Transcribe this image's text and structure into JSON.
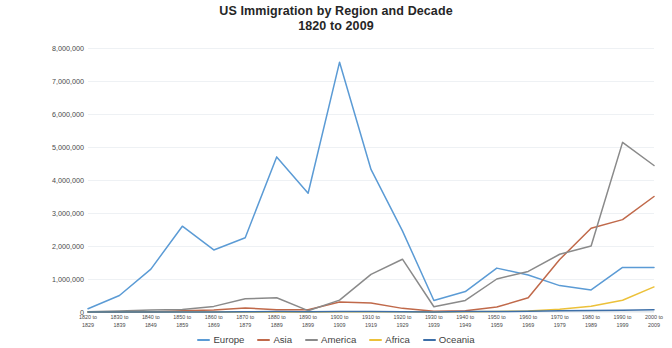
{
  "chart_data": {
    "type": "line",
    "title": "US Immigration by Region and Decade",
    "subtitle": "1820 to 2009",
    "xlabel": "",
    "ylabel": "",
    "ylim": [
      0,
      8000000
    ],
    "ytick_labels": [
      "0",
      "1,000,000",
      "2,000,000",
      "3,000,000",
      "4,000,000",
      "5,000,000",
      "6,000,000",
      "7,000,000",
      "8,000,000"
    ],
    "ytick_values": [
      0,
      1000000,
      2000000,
      3000000,
      4000000,
      5000000,
      6000000,
      7000000,
      8000000
    ],
    "grid": true,
    "legend_position": "bottom",
    "categories": [
      "1820 to 1829",
      "1830 to 1839",
      "1840 to 1849",
      "1850 to 1859",
      "1860 to 1869",
      "1870 to 1879",
      "1880 to 1889",
      "1890 to 1899",
      "1900 to 1909",
      "1910 to 1919",
      "1920 to 1929",
      "1930 to 1939",
      "1940 to 1949",
      "1950 to 1959",
      "1960 to 1969",
      "1970 to 1979",
      "1980 to 1989",
      "1990 to 1999",
      "2000 to 2009"
    ],
    "category_lines": [
      [
        "1820 to",
        "1829"
      ],
      [
        "1830 to",
        "1839"
      ],
      [
        "1840 to",
        "1849"
      ],
      [
        "1850 to",
        "1859"
      ],
      [
        "1860 to",
        "1869"
      ],
      [
        "1870 to",
        "1879"
      ],
      [
        "1880 to",
        "1889"
      ],
      [
        "1890 to",
        "1899"
      ],
      [
        "1900 to",
        "1909"
      ],
      [
        "1910 to",
        "1919"
      ],
      [
        "1920 to",
        "1929"
      ],
      [
        "1930 to",
        "1939"
      ],
      [
        "1940 to",
        "1949"
      ],
      [
        "1950 to",
        "1959"
      ],
      [
        "1960 to",
        "1969"
      ],
      [
        "1970 to",
        "1979"
      ],
      [
        "1980 to",
        "1989"
      ],
      [
        "1990 to",
        "1999"
      ],
      [
        "2000 to",
        "2009"
      ]
    ],
    "series": [
      {
        "name": "Europe",
        "color": "#5b9bd5",
        "values": [
          100000,
          500000,
          1300000,
          2600000,
          1880000,
          2250000,
          4700000,
          3600000,
          7570000,
          4320000,
          2460000,
          350000,
          620000,
          1330000,
          1120000,
          800000,
          670000,
          1350000,
          1350000
        ]
      },
      {
        "name": "Asia",
        "color": "#c0694a",
        "values": [
          0,
          0,
          0,
          40000,
          60000,
          120000,
          70000,
          70000,
          300000,
          270000,
          110000,
          20000,
          35000,
          150000,
          430000,
          1590000,
          2540000,
          2800000,
          3500000
        ]
      },
      {
        "name": "America",
        "color": "#8a8a8a",
        "values": [
          10000,
          30000,
          60000,
          75000,
          170000,
          400000,
          430000,
          40000,
          360000,
          1140000,
          1600000,
          160000,
          350000,
          1000000,
          1230000,
          1750000,
          2000000,
          5140000,
          4440000
        ]
      },
      {
        "name": "Africa",
        "color": "#ecc13a",
        "values": [
          0,
          0,
          0,
          0,
          0,
          0,
          0,
          0,
          7000,
          8000,
          6000,
          2000,
          7000,
          14000,
          29000,
          80000,
          177000,
          355000,
          760000
        ]
      },
      {
        "name": "Oceania",
        "color": "#3d6fa8",
        "values": [
          0,
          0,
          0,
          0,
          0,
          10000,
          13000,
          4000,
          13000,
          13000,
          9000,
          2000,
          14000,
          12000,
          25000,
          41000,
          42000,
          56000,
          65000
        ]
      }
    ]
  }
}
